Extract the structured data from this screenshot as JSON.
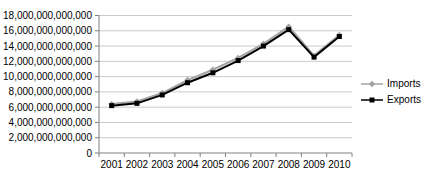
{
  "chart_data": {
    "type": "line",
    "title": "",
    "xlabel": "",
    "ylabel": "",
    "categories": [
      "2001",
      "2002",
      "2003",
      "2004",
      "2005",
      "2006",
      "2007",
      "2008",
      "2009",
      "2010"
    ],
    "series": [
      {
        "name": "Imports",
        "color": "#a3a3a3",
        "marker": "diamond",
        "values": [
          6400000000000,
          6750000000000,
          7850000000000,
          9550000000000,
          10900000000000,
          12450000000000,
          14300000000000,
          16550000000000,
          12750000000000,
          15450000000000
        ]
      },
      {
        "name": "Exports",
        "color": "#000000",
        "marker": "square",
        "values": [
          6200000000000,
          6500000000000,
          7600000000000,
          9200000000000,
          10500000000000,
          12100000000000,
          14000000000000,
          16150000000000,
          12550000000000,
          15250000000000
        ]
      }
    ],
    "ylim": [
      0,
      18000000000000
    ],
    "ytick_step": 2000000000000,
    "ytick_labels": [
      "0",
      "2,000,000,000,000",
      "4,000,000,000,000",
      "6,000,000,000,000",
      "8,000,000,000,000",
      "10,000,000,000,000",
      "12,000,000,000,000",
      "14,000,000,000,000",
      "16,000,000,000,000",
      "18,000,000,000,000"
    ],
    "grid": true,
    "legend_position": "right",
    "legend_labels": [
      "Imports",
      "Exports"
    ]
  },
  "style": {
    "gridline_color": "#c9c9c9",
    "axis_color": "#808080",
    "text_color": "#000000",
    "background": "#ffffff"
  }
}
